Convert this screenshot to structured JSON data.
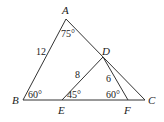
{
  "diagram": {
    "vertices": [
      {
        "id": "A",
        "label": "A"
      },
      {
        "id": "B",
        "label": "B"
      },
      {
        "id": "C",
        "label": "C"
      },
      {
        "id": "D",
        "label": "D"
      },
      {
        "id": "E",
        "label": "E"
      },
      {
        "id": "F",
        "label": "F"
      }
    ],
    "segments": [
      {
        "from": "A",
        "to": "B"
      },
      {
        "from": "A",
        "to": "C"
      },
      {
        "from": "B",
        "to": "C"
      },
      {
        "from": "D",
        "to": "E"
      },
      {
        "from": "D",
        "to": "F"
      }
    ],
    "lengths": {
      "AB": "12",
      "DE": "8",
      "DF": "6"
    },
    "angles": {
      "A": "75°",
      "B": "60°",
      "E": "45°",
      "F": "60°"
    },
    "colors": {
      "stroke": "#333333",
      "text": "#222222",
      "background": "#ffffff"
    }
  }
}
